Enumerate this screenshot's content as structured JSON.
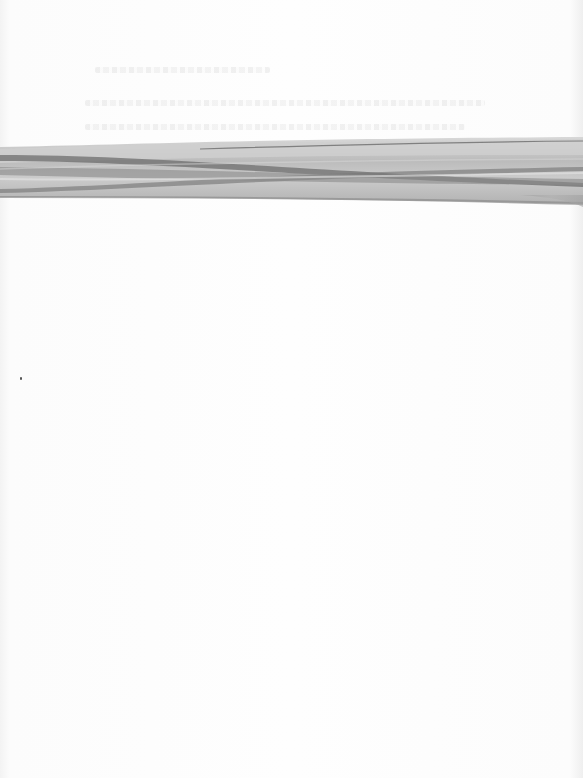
{
  "document": {
    "type": "scanned-page",
    "description": "Mostly blank scanned page with a twisted gray ribbon across the upper portion and faint, illegible show-through text above it",
    "bleed_through_lines": [
      {
        "top": 67,
        "left": 95,
        "width": 175
      },
      {
        "top": 100,
        "left": 85,
        "width": 400
      },
      {
        "top": 124,
        "left": 85,
        "width": 380
      }
    ],
    "ribbon": {
      "top": 140,
      "bottom": 205,
      "colors": {
        "light": "#c8c8c8",
        "mid": "#a6a6a6",
        "dark": "#6e6e6e"
      }
    },
    "specks": [
      {
        "x": 20,
        "y": 377
      }
    ]
  }
}
